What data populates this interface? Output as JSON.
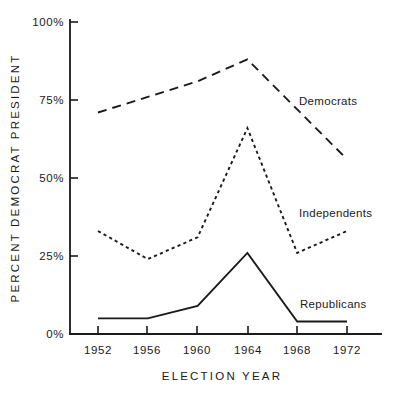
{
  "chart_data": {
    "type": "line",
    "title": "",
    "xlabel": "ELECTION YEAR",
    "ylabel": "PERCENT DEMOCRAT PRESIDENT",
    "categories": [
      "1952",
      "1956",
      "1960",
      "1964",
      "1968",
      "1972"
    ],
    "x": [
      1952,
      1956,
      1960,
      1964,
      1968,
      1972
    ],
    "xlim": [
      1950,
      1974
    ],
    "ylim": [
      0,
      100
    ],
    "ytick_labels": [
      "0%",
      "25%",
      "50%",
      "75%",
      "100%"
    ],
    "ytick_values": [
      0,
      25,
      50,
      75,
      100
    ],
    "grid": false,
    "legend": "inline-labels-right",
    "series": [
      {
        "name": "Democrats",
        "style": "long-dashed",
        "label_x": 1965.6,
        "label_y": 75,
        "values": [
          71,
          76,
          81,
          88,
          72,
          56
        ]
      },
      {
        "name": "Independents",
        "style": "short-dashed",
        "label_x": 1965.6,
        "label_y": 39,
        "values": [
          33,
          24,
          31,
          66,
          26,
          33
        ]
      },
      {
        "name": "Republicans",
        "style": "solid",
        "label_x": 1965.6,
        "label_y": 10,
        "values": [
          5,
          5,
          9,
          26,
          4,
          4
        ]
      }
    ]
  },
  "axis": {
    "y_label_text": "PERCENT DEMOCRAT PRESIDENT",
    "x_label_text": "ELECTION YEAR"
  }
}
